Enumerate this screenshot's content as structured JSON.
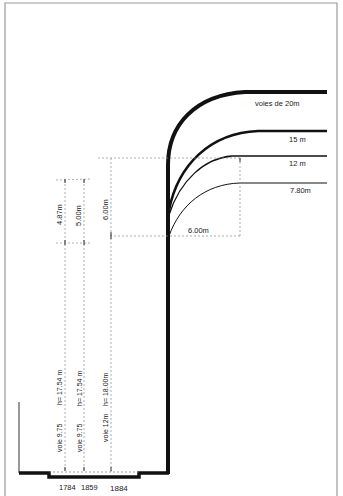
{
  "diagram": {
    "type": "street-section-setback",
    "street_widths": [
      {
        "label": "voies de  20m"
      },
      {
        "label": "15 m"
      },
      {
        "label": "12 m"
      },
      {
        "label": "7.80m"
      }
    ],
    "dimensions": {
      "offset_horizontal": "6.00m",
      "vert_a": "4.87m",
      "vert_b": "5.00m",
      "vert_c": "6.00m"
    },
    "heights": [
      {
        "voie": "voie 9.75",
        "h": "h= 17.54 m"
      },
      {
        "voie": "voie 9.75",
        "h": "h= 17.54 m"
      },
      {
        "voie": "voie 12m",
        "h": "h= 18.00m"
      }
    ],
    "years": [
      "1784",
      "1859",
      "1884"
    ],
    "colors": {
      "ink": "#1a1a1a",
      "frame": "#9a9a9a",
      "dash": "#8a8a8a"
    }
  }
}
